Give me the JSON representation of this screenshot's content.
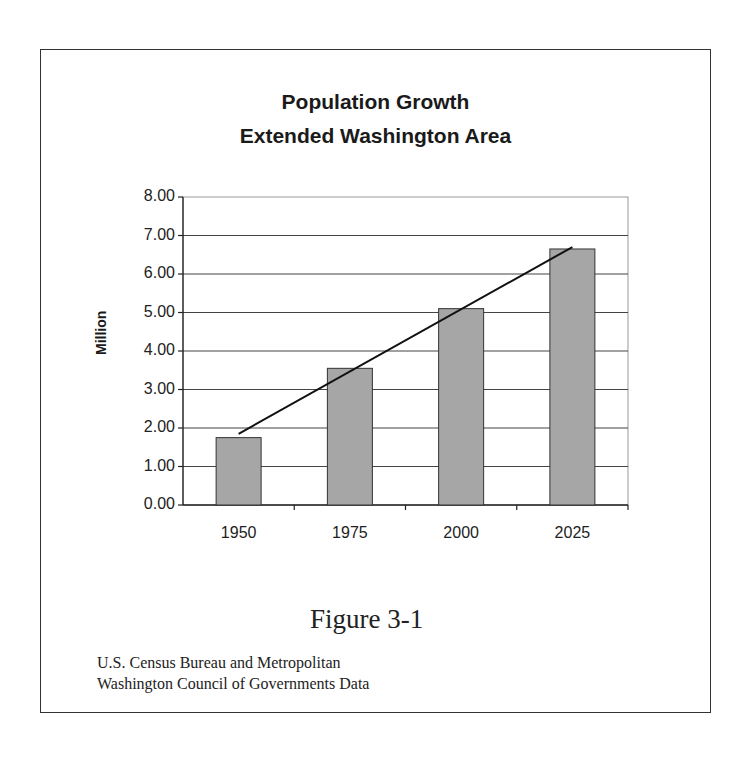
{
  "figure": {
    "title_line1": "Population Growth",
    "title_line2": "Extended Washington Area",
    "caption": "Figure 3-1",
    "source_line1": "U.S. Census Bureau and Metropolitan",
    "source_line2": "Washington Council of Governments Data"
  },
  "axes": {
    "ylabel": "Million",
    "yticks": [
      "8.00",
      "7.00",
      "6.00",
      "5.00",
      "4.00",
      "3.00",
      "2.00",
      "1.00",
      "0.00"
    ],
    "xticks": [
      "1950",
      "1975",
      "2000",
      "2025"
    ]
  },
  "colors": {
    "bar_fill": "#a6a6a6",
    "bar_stroke": "#333333",
    "gridline": "#444444",
    "trendline": "#111111"
  },
  "chart_data": {
    "type": "bar",
    "xlabel": "",
    "ylabel": "Million",
    "categories": [
      "1950",
      "1975",
      "2000",
      "2025"
    ],
    "values": [
      1.75,
      3.55,
      5.1,
      6.65
    ],
    "ylim": [
      0,
      8
    ],
    "ytick_step": 1,
    "grid": true,
    "legend": "none",
    "overlays": [
      {
        "type": "line",
        "name": "linear trend",
        "x": [
          "1950",
          "2025"
        ],
        "values": [
          1.85,
          6.7
        ]
      }
    ]
  }
}
